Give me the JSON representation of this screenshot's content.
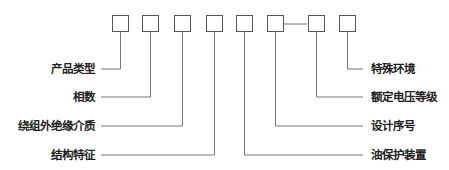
{
  "diagram": {
    "title": "",
    "boxes": [
      {
        "x": 112
      },
      {
        "x": 142
      },
      {
        "x": 174
      },
      {
        "x": 206
      },
      {
        "x": 236
      },
      {
        "x": 267
      },
      {
        "x": 308
      },
      {
        "x": 339
      }
    ],
    "separator": "—",
    "left_labels": [
      {
        "text": "产品类型",
        "y": 69,
        "box_index": 0
      },
      {
        "text": "相数",
        "y": 97,
        "box_index": 1
      },
      {
        "text": "绕组外绝缘介质",
        "y": 126,
        "box_index": 2
      },
      {
        "text": "结构特征",
        "y": 155,
        "box_index": 3
      }
    ],
    "right_labels": [
      {
        "text": "特殊环境",
        "y": 69,
        "box_index": 7
      },
      {
        "text": "额定电压等级",
        "y": 97,
        "box_index": 6
      },
      {
        "text": "设计序号",
        "y": 126,
        "box_index": 5
      },
      {
        "text": "油保护装置",
        "y": 155,
        "box_index": 4
      }
    ],
    "line_color": "#777777",
    "box_color": "#555555"
  }
}
